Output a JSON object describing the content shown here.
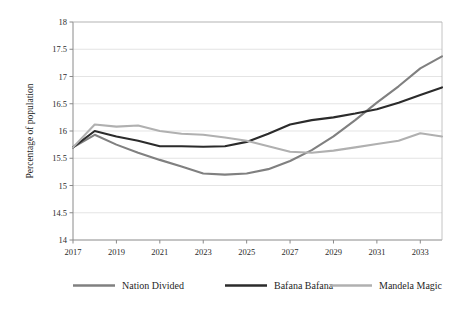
{
  "chart_data": {
    "type": "line",
    "title": "",
    "xlabel": "",
    "ylabel": "Percentage of population",
    "x": [
      2017,
      2018,
      2019,
      2020,
      2021,
      2022,
      2023,
      2024,
      2025,
      2026,
      2027,
      2028,
      2029,
      2030,
      2031,
      2032,
      2033,
      2034
    ],
    "xticks": [
      "2017",
      "2019",
      "2021",
      "2023",
      "2025",
      "2027",
      "2029",
      "2031",
      "2033"
    ],
    "xtick_values": [
      2017,
      2019,
      2021,
      2023,
      2025,
      2027,
      2029,
      2031,
      2033
    ],
    "yticks": [
      "14",
      "14.5",
      "15",
      "15.5",
      "16",
      "16.5",
      "17",
      "17.5",
      "18"
    ],
    "ytick_values": [
      14,
      14.5,
      15,
      15.5,
      16,
      16.5,
      17,
      17.5,
      18
    ],
    "ylim": [
      14,
      18
    ],
    "xlim": [
      2017,
      2034
    ],
    "grid": "horizontal",
    "legend_position": "bottom",
    "series": [
      {
        "name": "Nation Divided",
        "color": "#808080",
        "values": [
          15.7,
          15.93,
          15.75,
          15.6,
          15.47,
          15.35,
          15.22,
          15.2,
          15.22,
          15.3,
          15.45,
          15.65,
          15.9,
          16.2,
          16.52,
          16.82,
          17.15,
          17.37
        ]
      },
      {
        "name": "Bafana Bafana",
        "color": "#2b2b2b",
        "values": [
          15.7,
          16.0,
          15.9,
          15.82,
          15.72,
          15.72,
          15.71,
          15.72,
          15.8,
          15.95,
          16.12,
          16.2,
          16.25,
          16.32,
          16.4,
          16.52,
          16.66,
          16.8
        ]
      },
      {
        "name": "Mandela Magic",
        "color": "#b0b0b0",
        "values": [
          15.7,
          16.12,
          16.08,
          16.1,
          16.0,
          15.95,
          15.93,
          15.88,
          15.82,
          15.72,
          15.62,
          15.6,
          15.64,
          15.7,
          15.76,
          15.82,
          15.96,
          15.9
        ]
      }
    ]
  },
  "legend": {
    "items": [
      {
        "label": "Nation Divided"
      },
      {
        "label": "Bafana Bafana"
      },
      {
        "label": "Mandela Magic"
      }
    ]
  }
}
